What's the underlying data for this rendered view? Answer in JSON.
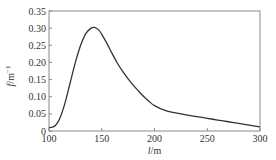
{
  "chart_data": {
    "type": "line",
    "title": "",
    "xlabel": "l/m",
    "ylabel": "f/m^-1",
    "xlim": [
      100,
      300
    ],
    "ylim": [
      0,
      0.35
    ],
    "grid": false,
    "legend": null,
    "xticks": [
      100,
      150,
      200,
      250,
      300
    ],
    "xtick_labels": [
      "100",
      "150",
      "200",
      "250",
      "300"
    ],
    "yticks": [
      0,
      0.05,
      0.1,
      0.15,
      0.2,
      0.25,
      0.3,
      0.35
    ],
    "ytick_labels": [
      "0",
      "0.05",
      "0.10",
      "0.15",
      "0.20",
      "0.25",
      "0.30",
      "0.35"
    ],
    "series": [
      {
        "name": "f(l)",
        "color": "#333333",
        "x": [
          100,
          103,
          106,
          110,
          115,
          120,
          125,
          130,
          135,
          140,
          143,
          147,
          150,
          155,
          160,
          165,
          170,
          175,
          180,
          185,
          190,
          195,
          200,
          210,
          220,
          230,
          240,
          250,
          260,
          270,
          280,
          290,
          300
        ],
        "y": [
          0.01,
          0.011,
          0.016,
          0.035,
          0.08,
          0.14,
          0.2,
          0.25,
          0.285,
          0.3,
          0.302,
          0.295,
          0.282,
          0.255,
          0.225,
          0.197,
          0.173,
          0.152,
          0.133,
          0.116,
          0.1,
          0.086,
          0.074,
          0.06,
          0.053,
          0.047,
          0.042,
          0.037,
          0.032,
          0.027,
          0.022,
          0.017,
          0.012
        ]
      }
    ]
  }
}
